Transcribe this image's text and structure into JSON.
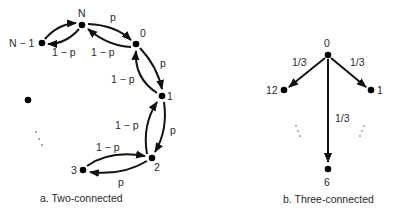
{
  "diagrams": [
    {
      "id": "two-connected",
      "caption": "a. Two-connected",
      "nodes": {
        "n": "N",
        "n_minus_1": "N − 1",
        "zero": "0",
        "one": "1",
        "two": "2",
        "three": "3"
      },
      "edges": [
        {
          "from": "N-1",
          "to": "N",
          "label": ""
        },
        {
          "from": "N",
          "to": "N-1",
          "label": "1 − p"
        },
        {
          "from": "N",
          "to": "0",
          "label": "p"
        },
        {
          "from": "0",
          "to": "N",
          "label": "1 − p"
        },
        {
          "from": "0",
          "to": "1",
          "label": "p"
        },
        {
          "from": "1",
          "to": "0",
          "label": "1 − p"
        },
        {
          "from": "1",
          "to": "2",
          "label": "p"
        },
        {
          "from": "2",
          "to": "1",
          "label": "1 − p"
        },
        {
          "from": "3",
          "to": "2",
          "label": "1 − p"
        },
        {
          "from": "2",
          "to": "3",
          "label": "p"
        }
      ],
      "edge_labels": {
        "n_to_nm1": "1 − p",
        "n_to_0": "p",
        "zero_to_n": "1 − p",
        "zero_to_1": "p",
        "one_to_0": "1 − p",
        "one_to_2": "p",
        "two_to_1": "1 − p",
        "three_to_2": "1 − p",
        "two_to_3": "p"
      },
      "ellipsis": "⋱"
    },
    {
      "id": "three-connected",
      "caption": "b. Three-connected",
      "nodes": {
        "zero": "0",
        "twelve": "12",
        "one": "1",
        "six": "6"
      },
      "edges": [
        {
          "from": "0",
          "to": "12",
          "label": "1/3"
        },
        {
          "from": "0",
          "to": "1",
          "label": "1/3"
        },
        {
          "from": "0",
          "to": "6",
          "label": "1/3"
        }
      ],
      "edge_labels": {
        "to_twelve": "1/3",
        "to_one": "1/3",
        "to_six": "1/3"
      }
    }
  ]
}
